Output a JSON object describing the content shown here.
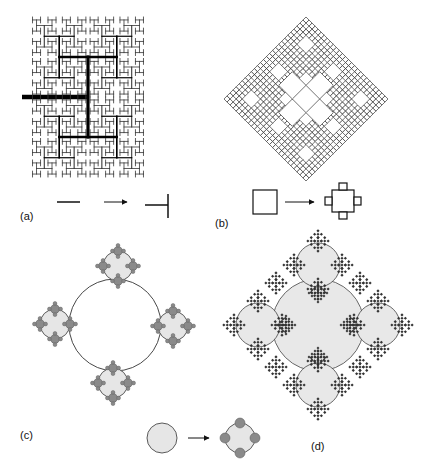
{
  "figure": {
    "background": "#ffffff",
    "colors": {
      "line": "#111111",
      "circle_fill": "#e6e6e6",
      "dot_fill": "#8a8a8a",
      "outline": "#333333"
    }
  },
  "panels": [
    {
      "id": "a",
      "label": "(a)",
      "title": "H-tree fractal",
      "generator": {
        "from": "line segment",
        "to": "T-junction (line with perpendicular bar)"
      },
      "label_pos": [
        20,
        210
      ]
    },
    {
      "id": "b",
      "label": "(b)",
      "title": "Square-based fractal (diamond)",
      "generator": {
        "from": "square",
        "to": "square with four small squares on each side"
      },
      "label_pos": [
        215,
        217
      ]
    },
    {
      "id": "c",
      "label": "(c)",
      "title": "Circle fractal",
      "generator": {
        "from": "circle",
        "to": "circle with four small circles"
      },
      "label_pos": [
        20,
        429
      ]
    },
    {
      "id": "d",
      "label": "(d)",
      "title": "Combined circle/square fractal",
      "label_pos": [
        311,
        440
      ]
    }
  ]
}
